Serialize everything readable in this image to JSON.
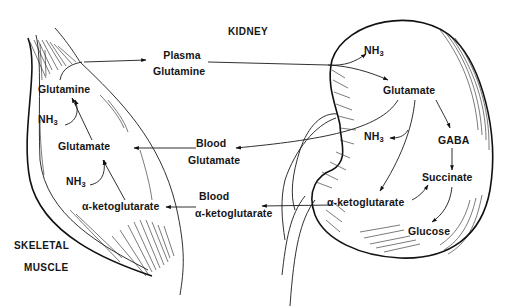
{
  "organs": {
    "kidney": "KIDNEY",
    "muscle_line1": "SKELETAL",
    "muscle_line2": "MUSCLE"
  },
  "muscle": {
    "glutamine": "Glutamine",
    "nh3": "NH",
    "nh3_sub": "3",
    "glutamate": "Glutamate",
    "nh3_b": "NH",
    "nh3_b_sub": "3",
    "akg": "α-ketoglutarate"
  },
  "blood": {
    "plasma_line1": "Plasma",
    "plasma_line2": "Glutamine",
    "glu_line1": "Blood",
    "glu_line2": "Glutamate",
    "akg_line1": "Blood",
    "akg_line2": "α-ketoglutarate"
  },
  "kidney": {
    "nh3_top": "NH",
    "nh3_top_sub": "3",
    "glutamate": "Glutamate",
    "nh3_mid": "NH",
    "nh3_mid_sub": "3",
    "gaba": "GABA",
    "succinate": "Succinate",
    "akg": "α-ketoglutarate",
    "glucose": "Glucose"
  },
  "pathway_edges": [
    {
      "from": "muscle.glutamine",
      "to": "blood.plasma_glutamine"
    },
    {
      "from": "blood.plasma_glutamine",
      "to": "kidney.glutamate",
      "releases": "NH3"
    },
    {
      "from": "kidney.glutamate",
      "to": "kidney.akg",
      "releases": "NH3"
    },
    {
      "from": "kidney.glutamate",
      "to": "kidney.gaba"
    },
    {
      "from": "kidney.glutamate",
      "to": "blood.glutamate"
    },
    {
      "from": "kidney.gaba",
      "to": "kidney.succinate"
    },
    {
      "from": "kidney.akg",
      "to": "kidney.succinate"
    },
    {
      "from": "kidney.succinate",
      "to": "kidney.glucose"
    },
    {
      "from": "kidney.akg",
      "to": "blood.akg"
    },
    {
      "from": "blood.glutamate",
      "to": "muscle.glutamate"
    },
    {
      "from": "blood.akg",
      "to": "muscle.akg"
    },
    {
      "from": "muscle.akg",
      "to": "muscle.glutamate",
      "consumes": "NH3"
    },
    {
      "from": "muscle.glutamate",
      "to": "muscle.glutamine",
      "consumes": "NH3"
    }
  ]
}
